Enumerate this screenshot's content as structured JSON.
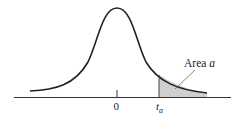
{
  "figure": {
    "type": "t-distribution-upper-tail",
    "area_label_prefix": "Area ",
    "area_label_var": "a",
    "zero_label": "0",
    "t_label_main": "t",
    "t_label_sub": "a",
    "colors": {
      "curve": "#222222",
      "axis": "#333333",
      "shade": "#cfcfcf",
      "text": "#222222"
    }
  }
}
